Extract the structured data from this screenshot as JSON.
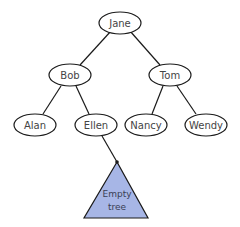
{
  "diagram": {
    "type": "binary-tree",
    "colors": {
      "stroke": "#1a1a1a",
      "node_fill": "#ffffff",
      "subtree_fill": "#a7b6e6",
      "text": "#444444"
    },
    "nodes": {
      "root": {
        "label": "Jane"
      },
      "left": {
        "label": "Bob"
      },
      "right": {
        "label": "Tom"
      },
      "left_left": {
        "label": "Alan"
      },
      "left_right": {
        "label": "Ellen"
      },
      "right_left": {
        "label": "Nancy"
      },
      "right_right": {
        "label": "Wendy"
      }
    },
    "subtree": {
      "line1": "Empty",
      "line2": "tree",
      "parent": "Ellen"
    },
    "edges": [
      [
        "Jane",
        "Bob"
      ],
      [
        "Jane",
        "Tom"
      ],
      [
        "Bob",
        "Alan"
      ],
      [
        "Bob",
        "Ellen"
      ],
      [
        "Tom",
        "Nancy"
      ],
      [
        "Tom",
        "Wendy"
      ],
      [
        "Ellen",
        "Empty tree"
      ]
    ]
  }
}
